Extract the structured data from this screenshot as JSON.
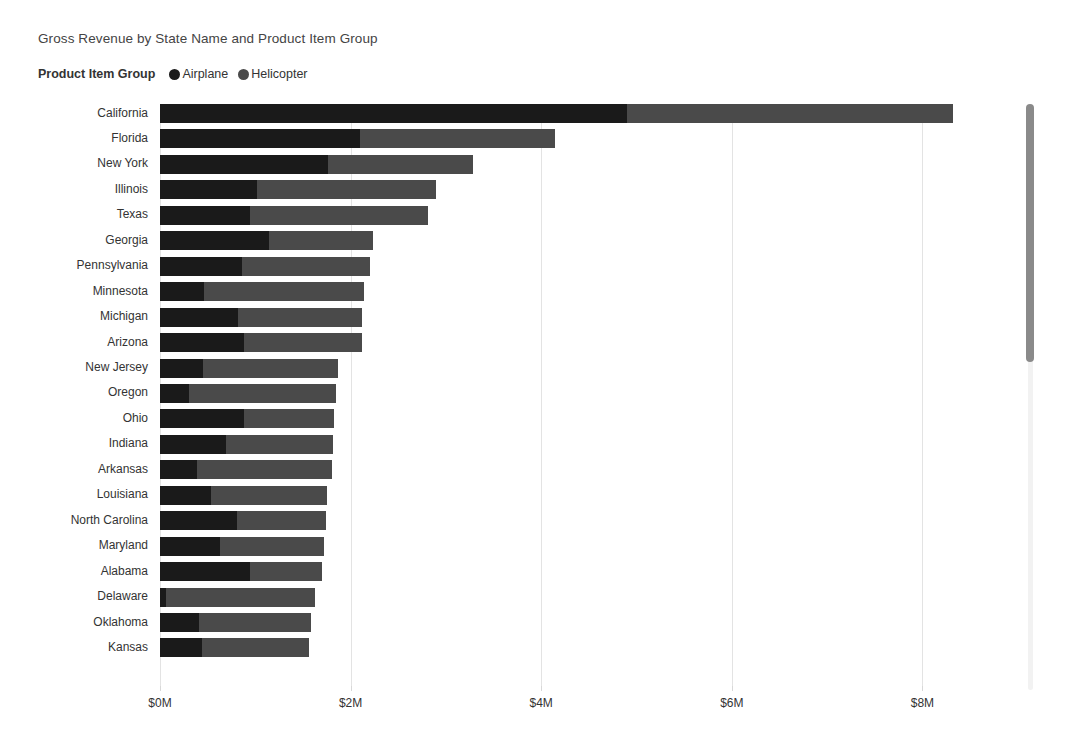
{
  "header": {
    "title": "Gross Revenue by State Name and Product Item Group"
  },
  "legend": {
    "title": "Product Item Group",
    "items": [
      {
        "label": "Airplane",
        "color": "#1a1a1a",
        "icon": "legend-dot-icon"
      },
      {
        "label": "Helicopter",
        "color": "#4a4a4a",
        "icon": "legend-dot-icon"
      }
    ]
  },
  "scrollbar": {
    "name": "vertical-scrollbar",
    "thumb_top_pct": 0,
    "thumb_height_pct": 44
  },
  "chart_data": {
    "type": "bar",
    "orientation": "horizontal",
    "stacked": true,
    "title": "Gross Revenue by State Name and Product Item Group",
    "xlabel": "",
    "ylabel": "",
    "xlim": [
      0,
      8.6
    ],
    "xticks": [
      0,
      2,
      4,
      6,
      8
    ],
    "xticklabels": [
      "$0M",
      "$2M",
      "$4M",
      "$6M",
      "$8M"
    ],
    "grid": true,
    "legend_position": "top-left",
    "units": "millions USD",
    "categories": [
      "California",
      "Florida",
      "New York",
      "Illinois",
      "Texas",
      "Georgia",
      "Pennsylvania",
      "Minnesota",
      "Michigan",
      "Arizona",
      "New Jersey",
      "Oregon",
      "Ohio",
      "Indiana",
      "Arkansas",
      "Louisiana",
      "North Carolina",
      "Maryland",
      "Alabama",
      "Delaware",
      "Oklahoma",
      "Kansas"
    ],
    "series": [
      {
        "name": "Airplane",
        "color": "#1a1a1a",
        "values": [
          4.9,
          2.1,
          1.76,
          1.02,
          0.94,
          1.14,
          0.86,
          0.46,
          0.82,
          0.88,
          0.45,
          0.3,
          0.88,
          0.69,
          0.39,
          0.53,
          0.81,
          0.63,
          0.94,
          0.06,
          0.41,
          0.44
        ]
      },
      {
        "name": "Helicopter",
        "color": "#4a4a4a",
        "values": [
          3.42,
          2.05,
          1.52,
          1.88,
          1.87,
          1.09,
          1.34,
          1.68,
          1.3,
          1.24,
          1.42,
          1.55,
          0.95,
          1.13,
          1.42,
          1.22,
          0.93,
          1.09,
          0.76,
          1.57,
          1.17,
          1.12
        ]
      }
    ],
    "totals": [
      8.32,
      4.15,
      3.28,
      2.9,
      2.81,
      2.23,
      2.2,
      2.14,
      2.12,
      2.12,
      1.87,
      1.85,
      1.83,
      1.82,
      1.81,
      1.75,
      1.74,
      1.72,
      1.7,
      1.63,
      1.58,
      1.56
    ]
  }
}
